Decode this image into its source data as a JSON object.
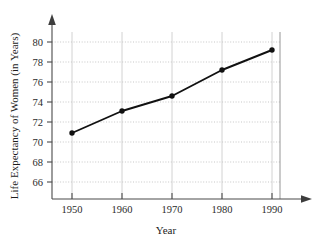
{
  "chart_data": {
    "type": "line",
    "title": "",
    "xlabel": "Year",
    "ylabel": "Life Expectancy of Women (in Years)",
    "x": [
      1950,
      1960,
      1970,
      1980,
      1990
    ],
    "categories": [
      "1950",
      "1960",
      "1970",
      "1980",
      "1990"
    ],
    "values": [
      70.9,
      73.1,
      74.6,
      77.2,
      79.2
    ],
    "series": [
      {
        "name": "Life Expectancy of Women",
        "values": [
          70.9,
          73.1,
          74.6,
          77.2,
          79.2
        ]
      }
    ],
    "xlim": [
      1945,
      1995
    ],
    "ylim": [
      64.4,
      81.0
    ],
    "xticks": [
      1950,
      1960,
      1970,
      1980,
      1990
    ],
    "yticks": [
      66,
      68,
      70,
      72,
      74,
      76,
      78,
      80
    ],
    "ytick_labels": [
      "66",
      "68",
      "70",
      "72",
      "74",
      "76",
      "78",
      "80"
    ],
    "xtick_labels": [
      "1950",
      "1960",
      "1970",
      "1980",
      "1990"
    ],
    "grid": "both-light-dotted",
    "legend": "none",
    "line_color": "#111111",
    "marker": "filled-circle",
    "marker_color": "#111111",
    "grid_color": "#b9b9b9",
    "axis_color": "#4a4a4a",
    "background_color": "#ffffff",
    "annotations": []
  },
  "axes": {
    "x_axis_name": "year-axis",
    "y_axis_name": "life-expectancy-axis",
    "x_arrow": "arrow-right",
    "y_arrow": "arrow-up"
  }
}
